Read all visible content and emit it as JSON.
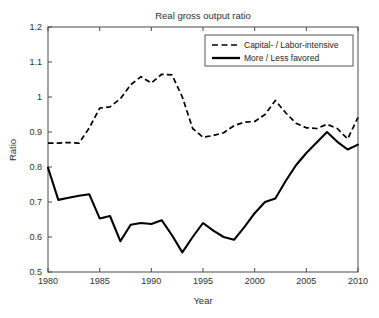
{
  "chart_data": {
    "type": "line",
    "title": "Real gross output ratio",
    "xlabel": "Year",
    "ylabel": "Ratio",
    "xlim": [
      1980,
      2010
    ],
    "ylim": [
      0.5,
      1.2
    ],
    "xticks": [
      1980,
      1985,
      1990,
      1995,
      2000,
      2005,
      2010
    ],
    "xtick_labels": [
      "1980",
      "1985",
      "1990",
      "1995",
      "2000",
      "2005",
      "2010"
    ],
    "yticks": [
      0.5,
      0.6,
      0.7,
      0.8,
      0.9,
      1.0,
      1.1,
      1.2
    ],
    "ytick_labels": [
      "0.5",
      "0.6",
      "0.7",
      "0.8",
      "0.9",
      "1",
      "1.1",
      "1.2"
    ],
    "grid": false,
    "legend_position": "upper right",
    "x": [
      1980,
      1981,
      1982,
      1983,
      1984,
      1985,
      1986,
      1987,
      1988,
      1989,
      1990,
      1991,
      1992,
      1993,
      1994,
      1995,
      1996,
      1997,
      1998,
      1999,
      2000,
      2001,
      2002,
      2003,
      2004,
      2005,
      2006,
      2007,
      2008,
      2009,
      2010
    ],
    "series": [
      {
        "name": "Capital- / Labor-intensive",
        "style": "dashed",
        "color": "#000000",
        "values": [
          0.868,
          0.868,
          0.87,
          0.868,
          0.912,
          0.968,
          0.972,
          0.995,
          1.035,
          1.058,
          1.04,
          1.065,
          1.063,
          1.0,
          0.91,
          0.885,
          0.89,
          0.898,
          0.918,
          0.928,
          0.93,
          0.95,
          0.99,
          0.955,
          0.925,
          0.912,
          0.91,
          0.922,
          0.91,
          0.88,
          0.942
        ]
      },
      {
        "name": "More / Less favored",
        "style": "solid",
        "color": "#000000",
        "values": [
          0.798,
          0.706,
          0.712,
          0.718,
          0.722,
          0.653,
          0.66,
          0.588,
          0.635,
          0.64,
          0.637,
          0.648,
          0.605,
          0.556,
          0.6,
          0.64,
          0.618,
          0.6,
          0.592,
          0.628,
          0.668,
          0.7,
          0.71,
          0.76,
          0.805,
          0.84,
          0.87,
          0.9,
          0.872,
          0.85,
          0.864
        ]
      }
    ]
  },
  "legend": {
    "entries": [
      {
        "label": "Capital- / Labor-intensive"
      },
      {
        "label": "More / Less favored"
      }
    ]
  }
}
